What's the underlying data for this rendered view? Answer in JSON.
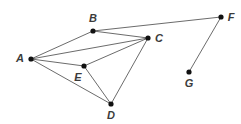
{
  "diagram": {
    "type": "undirected-graph",
    "title": "",
    "background_color": "#ffffff",
    "edge_color": "#5a5a5a",
    "vertex_color": "#111111",
    "label_color": "#3b3b3b",
    "canvas": {
      "width": 241,
      "height": 124
    },
    "vertices": [
      {
        "id": "A",
        "label": "A",
        "x": 31,
        "y": 59,
        "label_x": 20,
        "label_y": 58
      },
      {
        "id": "B",
        "label": "B",
        "x": 93,
        "y": 31,
        "label_x": 93,
        "label_y": 18
      },
      {
        "id": "C",
        "label": "C",
        "x": 148,
        "y": 38,
        "label_x": 159,
        "label_y": 38
      },
      {
        "id": "D",
        "label": "D",
        "x": 111,
        "y": 104,
        "label_x": 111,
        "label_y": 115
      },
      {
        "id": "E",
        "label": "E",
        "x": 84,
        "y": 66,
        "label_x": 78,
        "label_y": 77
      },
      {
        "id": "F",
        "label": "F",
        "x": 221,
        "y": 17,
        "label_x": 231,
        "label_y": 17
      },
      {
        "id": "G",
        "label": "G",
        "x": 189,
        "y": 72,
        "label_x": 189,
        "label_y": 83
      }
    ],
    "edges": [
      {
        "from": "A",
        "to": "B"
      },
      {
        "from": "A",
        "to": "C"
      },
      {
        "from": "A",
        "to": "E"
      },
      {
        "from": "A",
        "to": "D"
      },
      {
        "from": "B",
        "to": "C"
      },
      {
        "from": "B",
        "to": "F"
      },
      {
        "from": "C",
        "to": "E"
      },
      {
        "from": "C",
        "to": "D"
      },
      {
        "from": "E",
        "to": "D"
      },
      {
        "from": "F",
        "to": "G"
      }
    ],
    "vertex_radius": 2.6
  }
}
